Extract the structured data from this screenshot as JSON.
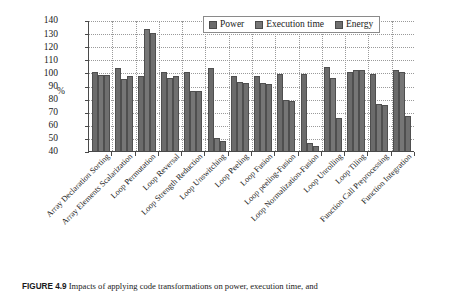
{
  "figure": {
    "label": "FIGURE 4.9",
    "caption": "Impacts of applying code transformations on power, execution time, and"
  },
  "legend": {
    "position": "top-right",
    "items": [
      {
        "label": "Power",
        "color": "#6b6b6b"
      },
      {
        "label": "Execution time",
        "color": "#767676"
      },
      {
        "label": "Energy",
        "color": "#6f6f6f"
      }
    ]
  },
  "axes": {
    "ylabel": "%",
    "yticks": [
      40,
      50,
      60,
      70,
      80,
      90,
      100,
      110,
      120,
      130,
      140
    ]
  },
  "chart_data": {
    "type": "bar",
    "title": "",
    "xlabel": "",
    "ylabel": "%",
    "ylim": [
      40,
      140
    ],
    "ytick_step": 10,
    "grid": true,
    "legend_position": "top-right",
    "categories": [
      "Array Declaration Sorting",
      "Array Elements Scalarization",
      "Loop Permutation",
      "Loop Reversal",
      "Loop Strength Reduction",
      "Loop Unswitching",
      "Loop Peeling",
      "Loop Fusion",
      "Loop peeling-Fusion",
      "Loop Normalization-Fusion",
      "Loop Unrolling",
      "Loop Tiling",
      "Function Call Preprocessing",
      "Function Integration"
    ],
    "series": [
      {
        "name": "Power",
        "color": "#6b6b6b",
        "values": [
          100,
          103,
          97,
          100,
          100,
          103,
          97,
          97,
          99,
          99,
          104,
          100,
          99,
          102
        ]
      },
      {
        "name": "Execution time",
        "color": "#767676",
        "values": [
          98,
          95,
          133,
          96,
          86,
          50,
          93,
          92,
          79,
          46,
          96,
          102,
          76,
          100
        ]
      },
      {
        "name": "Energy",
        "color": "#6f6f6f",
        "values": [
          98,
          97,
          130,
          97,
          86,
          48,
          92,
          91,
          78,
          44,
          65,
          102,
          75,
          67
        ]
      }
    ]
  }
}
